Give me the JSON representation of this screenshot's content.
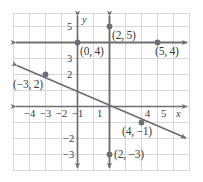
{
  "figure": {
    "kind": "coordinate-plane-graph",
    "colors": {
      "grid": "#d8d8dc",
      "frame": "#cfcfd4",
      "axis": "#6e6e77",
      "line": "#6e6e77",
      "text": "#3b3b3f",
      "background": "#ffffff"
    },
    "geometry": {
      "unit_px": 16,
      "origin_px": {
        "x": 93,
        "y": 106
      },
      "x_range": [
        -5,
        6
      ],
      "y_range": [
        -4,
        6
      ]
    }
  },
  "axes": {
    "x_axis_name": "x",
    "y_axis_name": "y",
    "x_ticks": [
      {
        "value": -4,
        "label": "−4"
      },
      {
        "value": -3,
        "label": "−3"
      },
      {
        "value": -2,
        "label": "−2"
      },
      {
        "value": -1,
        "label": "−1"
      },
      {
        "value": 1,
        "label": "1"
      },
      {
        "value": 4,
        "label": "4"
      },
      {
        "value": 5,
        "label": "5"
      }
    ],
    "y_ticks": [
      {
        "value": 5,
        "label": "5"
      },
      {
        "value": 3,
        "label": "3"
      },
      {
        "value": 2,
        "label": "2"
      },
      {
        "value": -2,
        "label": "−2"
      },
      {
        "value": -3,
        "label": "−3"
      }
    ]
  },
  "lines": [
    {
      "name": "horizontal-line-y-equals-4",
      "type": "horizontal",
      "equation_y": 4,
      "arrows": "both"
    },
    {
      "name": "vertical-line-x-equals-2",
      "type": "vertical",
      "equation_x": 2,
      "arrows": "both"
    },
    {
      "name": "diagonal-line",
      "type": "diagonal",
      "through": [
        [
          -3,
          2
        ],
        [
          4,
          -1
        ]
      ],
      "slope": -0.4286,
      "arrows": "both"
    }
  ],
  "points": [
    {
      "name": "point-0-4",
      "x": 0,
      "y": 4,
      "label": "(0, 4)"
    },
    {
      "name": "point-5-4",
      "x": 5,
      "y": 4,
      "label": "(5, 4)"
    },
    {
      "name": "point-2-5",
      "x": 2,
      "y": 5,
      "label": "(2, 5)"
    },
    {
      "name": "point-2-n3",
      "x": 2,
      "y": -3,
      "label": "(2, −3)"
    },
    {
      "name": "point-n3-2",
      "x": -3,
      "y": 2,
      "label": "(−3, 2)"
    },
    {
      "name": "point-4-n1",
      "x": 4,
      "y": -1,
      "label": "(4, −1)"
    }
  ]
}
